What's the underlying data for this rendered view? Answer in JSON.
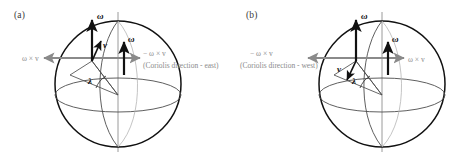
{
  "figure": {
    "type": "scientific-diagram",
    "panels": [
      {
        "id": "a",
        "label": "(a)",
        "velocity_direction": "northward",
        "vectors": [
          {
            "name": "omega-polar",
            "label": "ω",
            "direction": "up",
            "color": "#111111"
          },
          {
            "name": "omega-local",
            "label": "ω",
            "direction": "up",
            "color": "#111111"
          },
          {
            "name": "velocity",
            "label": "v",
            "direction": "up-right",
            "color": "#111111"
          }
        ],
        "gray_arrows": [
          {
            "name": "omega-cross-v-left",
            "label": "ω × v",
            "direction": "left",
            "color": "#8a8a8a"
          },
          {
            "name": "minus-omega-cross-v-right",
            "label": "− ω × v",
            "direction": "right",
            "color": "#8a8a8a"
          }
        ],
        "annotation": "(Coriolis direction - east)",
        "angle_label": "λ"
      },
      {
        "id": "b",
        "label": "(b)",
        "velocity_direction": "southward",
        "vectors": [
          {
            "name": "omega-polar",
            "label": "ω",
            "direction": "up",
            "color": "#111111"
          },
          {
            "name": "omega-local",
            "label": "ω",
            "direction": "up",
            "color": "#111111"
          },
          {
            "name": "velocity",
            "label": "v",
            "direction": "down-left",
            "color": "#111111"
          }
        ],
        "gray_arrows": [
          {
            "name": "minus-omega-cross-v-left",
            "label": "− ω × v",
            "direction": "left",
            "color": "#8a8a8a"
          },
          {
            "name": "omega-cross-v-right",
            "label": "ω × v",
            "direction": "right",
            "color": "#8a8a8a"
          }
        ],
        "annotation": "(Coriolis direction - west)",
        "angle_label": "λ"
      }
    ],
    "colors": {
      "sphere_outline": "#111111",
      "gray_arrow": "#8a8a8a",
      "gray_text": "#8a8a8a",
      "axis_line": "#9a9a9a",
      "grid_line": "#4d4d4d",
      "background": "#ffffff"
    }
  }
}
